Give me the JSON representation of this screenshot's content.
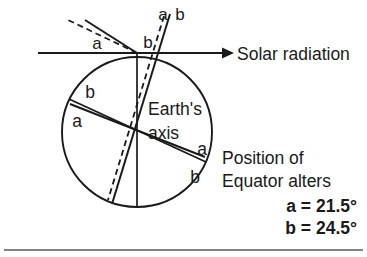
{
  "diagram": {
    "title_text": "Solar radiation",
    "axis_label_line1": "Earth's",
    "axis_label_line2": "axis",
    "caption_line1": "Position of",
    "caption_line2": "Equator alters",
    "value_a": "a = 21.5°",
    "value_b": "b = 24.5°",
    "angle_labels": {
      "top_pair_a": "a",
      "top_pair_b": "b",
      "upper_left_a": "a",
      "upper_left_b": "b",
      "equator_upper_left_b": "b",
      "equator_upper_left_a": "a",
      "equator_lower_right_a": "a",
      "equator_lower_right_b": "b"
    },
    "colors": {
      "ink": "#1a1a1a",
      "background": "#ffffff",
      "rule": "#5a5a5a"
    },
    "geometry": {
      "circle_center_x": 137,
      "circle_center_y": 132,
      "circle_radius": 75,
      "radiation_line_y": 53,
      "radiation_line_start_x": 38,
      "radiation_line_end_x": 226
    },
    "values": {
      "a_degrees": 21.5,
      "b_degrees": 24.5
    }
  }
}
